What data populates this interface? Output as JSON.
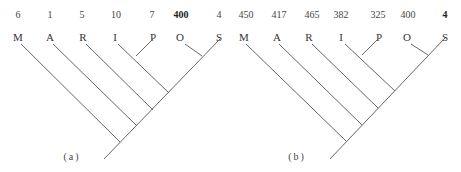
{
  "trees": [
    {
      "caption": "(a)",
      "taxa": [
        {
          "label": "M",
          "value": "6",
          "bold": false
        },
        {
          "label": "A",
          "value": "1",
          "bold": false
        },
        {
          "label": "R",
          "value": "5",
          "bold": false
        },
        {
          "label": "I",
          "value": "10",
          "bold": false
        },
        {
          "label": "P",
          "value": "7",
          "bold": false
        },
        {
          "label": "O",
          "value": "400",
          "bold": true
        },
        {
          "label": "S",
          "value": "4",
          "bold": false
        }
      ]
    },
    {
      "caption": "(b)",
      "taxa": [
        {
          "label": "M",
          "value": "450",
          "bold": false
        },
        {
          "label": "A",
          "value": "417",
          "bold": false
        },
        {
          "label": "R",
          "value": "465",
          "bold": false
        },
        {
          "label": "I",
          "value": "382",
          "bold": false
        },
        {
          "label": "P",
          "value": "325",
          "bold": false
        },
        {
          "label": "O",
          "value": "400",
          "bold": false
        },
        {
          "label": "S",
          "value": "4",
          "bold": true
        }
      ]
    }
  ],
  "colors": {
    "line": "#666666",
    "text": "#333333",
    "background": "#ffffff"
  }
}
